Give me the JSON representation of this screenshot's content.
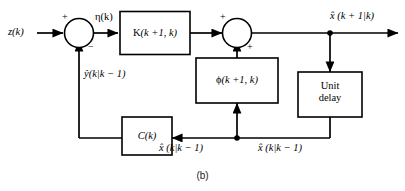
{
  "figure": {
    "caption": "(b)",
    "stroke_color": "#000000",
    "block_fill": "#ffffff",
    "background": "#ffffff"
  },
  "signals": {
    "input_measurement": "z(k)",
    "innovation": "η(k)",
    "predicted_output": "ŷ(k|k − 1)",
    "state_prediction_next": "x̂ (k + 1|k)",
    "state_prediction_left": "x̂ (k|k − 1)",
    "state_prediction_right": "x̂ (k|k − 1)"
  },
  "signs": {
    "summer_left_plus": "+",
    "summer_left_minus": "−",
    "summer_right_plus_top": "+",
    "summer_right_plus_bottom": "+"
  },
  "blocks": [
    {
      "id": "gain-k",
      "label": "K(k +1, k)",
      "label_head": "K",
      "label_tail": "(k +1, k)"
    },
    {
      "id": "transition-phi",
      "label": "ϕ(k +1, k)",
      "label_head": "ϕ",
      "label_tail": "(k +1, k)"
    },
    {
      "id": "output-matrix-c",
      "label": "C(k)"
    },
    {
      "id": "unit-delay",
      "label_line1": "Unit",
      "label_line2": "delay"
    }
  ],
  "summers": [
    {
      "id": "summer-left",
      "label": "Σ"
    },
    {
      "id": "summer-right",
      "label": "Σ"
    }
  ]
}
